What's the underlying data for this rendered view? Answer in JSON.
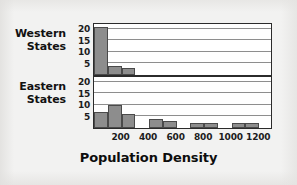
{
  "chart_data": {
    "type": "bar",
    "title": "",
    "xlabel": "Population Density",
    "ylabel": "",
    "xlim": [
      0,
      1300
    ],
    "ylim": [
      0,
      23
    ],
    "grid": true,
    "legend_position": "none",
    "orientation": "stacked-panels",
    "bin_width": 100,
    "xticks": [
      200,
      400,
      600,
      800,
      1000,
      1200
    ],
    "yticks": [
      5,
      10,
      15,
      20
    ],
    "panels": [
      {
        "name": "Western States",
        "label_line1": "Western",
        "label_line2": "States",
        "yticks": [
          20,
          15,
          10,
          5
        ],
        "bins": [
          {
            "x0": 0,
            "x1": 100,
            "value": 21
          },
          {
            "x0": 100,
            "x1": 200,
            "value": 4
          },
          {
            "x0": 200,
            "x1": 300,
            "value": 3
          },
          {
            "x0": 300,
            "x1": 400,
            "value": 0
          },
          {
            "x0": 400,
            "x1": 500,
            "value": 0
          },
          {
            "x0": 500,
            "x1": 600,
            "value": 0
          },
          {
            "x0": 600,
            "x1": 700,
            "value": 0
          },
          {
            "x0": 700,
            "x1": 800,
            "value": 0
          },
          {
            "x0": 800,
            "x1": 900,
            "value": 0
          },
          {
            "x0": 900,
            "x1": 1000,
            "value": 0
          },
          {
            "x0": 1000,
            "x1": 1100,
            "value": 0
          },
          {
            "x0": 1100,
            "x1": 1200,
            "value": 0
          },
          {
            "x0": 1200,
            "x1": 1300,
            "value": 0
          }
        ]
      },
      {
        "name": "Eastern States",
        "label_line1": "Eastern",
        "label_line2": "States",
        "yticks": [
          20,
          15,
          10,
          5
        ],
        "bins": [
          {
            "x0": 0,
            "x1": 100,
            "value": 7
          },
          {
            "x0": 100,
            "x1": 200,
            "value": 10
          },
          {
            "x0": 200,
            "x1": 300,
            "value": 6
          },
          {
            "x0": 300,
            "x1": 400,
            "value": 0
          },
          {
            "x0": 400,
            "x1": 500,
            "value": 4
          },
          {
            "x0": 500,
            "x1": 600,
            "value": 3
          },
          {
            "x0": 600,
            "x1": 700,
            "value": 0
          },
          {
            "x0": 700,
            "x1": 800,
            "value": 2
          },
          {
            "x0": 800,
            "x1": 900,
            "value": 2
          },
          {
            "x0": 900,
            "x1": 1000,
            "value": 0
          },
          {
            "x0": 1000,
            "x1": 1100,
            "value": 2
          },
          {
            "x0": 1100,
            "x1": 1200,
            "value": 2
          },
          {
            "x0": 1200,
            "x1": 1300,
            "value": 0
          }
        ]
      }
    ],
    "colors": {
      "bar_fill": "#8d8d8d",
      "bar_edge": "#4a4a4a",
      "panel_border": "#2b2b2b",
      "gridline": "#8e8e8e",
      "background": "#f2f2f1",
      "plot_background": "#ffffff",
      "text": "#111111"
    }
  }
}
